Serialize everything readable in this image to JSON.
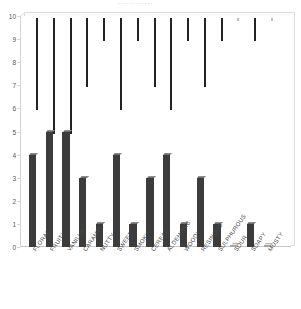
{
  "chart_data": {
    "type": "bar",
    "title": "",
    "xlabel": "",
    "ylabel": "",
    "ylim": [
      0,
      10
    ],
    "yticks": [
      0,
      1,
      2,
      3,
      4,
      5,
      6,
      7,
      8,
      9,
      10
    ],
    "grid": false,
    "legend": "none",
    "bar_color": "#3c3c3c",
    "plot_frame_color": "#d2d2d2",
    "categories": [
      "FLORAL",
      "FRUITY",
      "VANILLA",
      "CARAMEL",
      "NUTTY",
      "SWEET",
      "SMOKY",
      "CEREAL",
      "ALDEHYDIC",
      "WOODY",
      "RESINOUS",
      "SULPHUROUS",
      "SOUR",
      "SOAPY",
      "MUSTY"
    ],
    "values": [
      4,
      5,
      5,
      3,
      1,
      4,
      1,
      3,
      4,
      1,
      3,
      1,
      0,
      1,
      0
    ]
  },
  "axis": {
    "y_tick_labels": [
      "10",
      "9",
      "8",
      "7",
      "6",
      "5",
      "4",
      "3",
      "2",
      "1",
      "0"
    ]
  },
  "title_remnant": "............"
}
